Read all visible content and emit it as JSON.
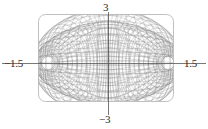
{
  "figure": {
    "title": "",
    "background_color": "#ffffff",
    "frame": {
      "name": "plot-frame",
      "stroke_color": "#b9b9b9",
      "corner_radius": 7,
      "x": 38,
      "y": 14,
      "width": 135,
      "height": 87
    },
    "axes": {
      "stroke_color": "#555555",
      "origin_x": 108,
      "origin_y": 63
    }
  },
  "chart_data": {
    "type": "line",
    "title": "",
    "subtitle": "",
    "xlabel": "",
    "ylabel": "",
    "grid": false,
    "legend": "none",
    "xlim": [
      -1.5,
      1.5
    ],
    "ylim": [
      -3,
      3
    ],
    "xticks": [
      -1.5,
      1.5
    ],
    "yticks": [
      -3,
      3
    ],
    "xtick_labels": [
      "−1.5",
      "1.5"
    ],
    "ytick_labels": [
      "−3",
      "3"
    ],
    "mesh": {
      "u_steps": 60,
      "v_steps": 34,
      "line_color": "#808080",
      "line_width": 0.35,
      "fill_color": "#ffffff"
    },
    "annotations": [
      {
        "text": "3",
        "position": "top",
        "value": 3
      },
      {
        "text": "−3",
        "position": "bottom",
        "value": -3
      },
      {
        "text": "−1.5",
        "position": "left",
        "value": -1.5
      },
      {
        "text": "1.5",
        "position": "right",
        "value": 1.5
      }
    ]
  },
  "labels": {
    "top": "3",
    "bottom": "−3",
    "left": "−1.5",
    "right": "1.5"
  }
}
